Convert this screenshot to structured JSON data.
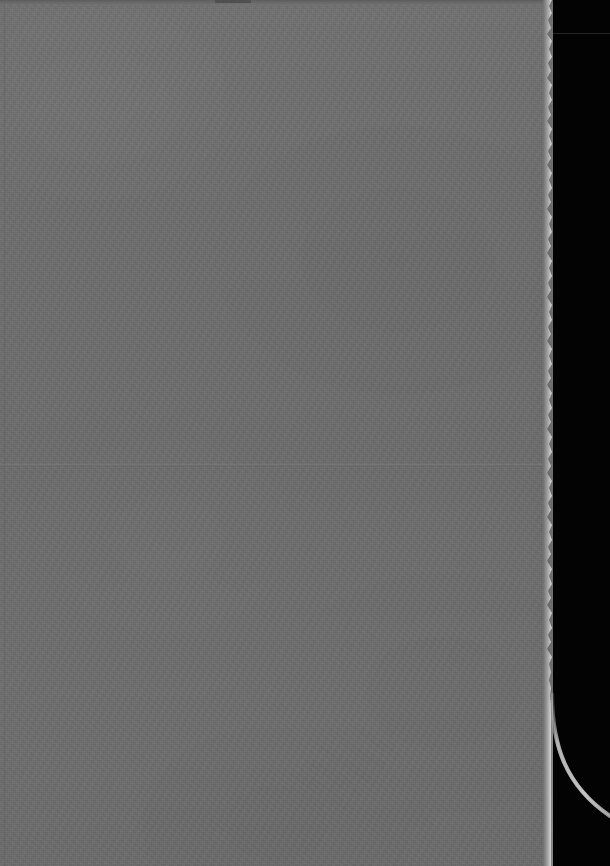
{
  "document": {
    "kind": "scanned-page",
    "page_state": "blank",
    "visible_text": "",
    "orientation": "portrait",
    "width_px": 610,
    "height_px": 866
  },
  "colors": {
    "paper": "#6f6f6f",
    "paper_top_edge": "#5d5d5d",
    "paper_top_notch": "#4e4e4e",
    "scanner_backdrop": "#030303",
    "torn_edge_highlight": "#d8d8d8",
    "crease_line": "#7e7e7e",
    "arc_line": "#b9b9b9",
    "backdrop_seam": "#2b2b2b"
  },
  "regions": {
    "paper_sheet": {
      "name": "paper-sheet",
      "left": 0,
      "top": 0,
      "width": 553,
      "height": 866
    },
    "scanner_backdrop": {
      "name": "scanner-backdrop",
      "left": 553,
      "top": 0,
      "width": 57,
      "height": 866
    }
  },
  "features": {
    "torn_right_edge": {
      "name": "torn-right-edge",
      "from_y": 0,
      "to_y": 700,
      "description": "ragged bright torn paper edge"
    },
    "smooth_right_edge": {
      "name": "smooth-right-edge",
      "from_y": 700,
      "to_y": 866
    },
    "horizontal_crease": {
      "name": "horizontal-crease",
      "y": 464
    },
    "left_fold_line": {
      "name": "left-fold-line",
      "x": 4
    },
    "top_edge_notch": {
      "name": "top-edge-notch",
      "x": 215,
      "width": 36
    },
    "curved_arc": {
      "name": "curved-arc",
      "start_x": 552,
      "start_y": 700,
      "end_x": 610,
      "end_y": 812
    },
    "backdrop_seam": {
      "name": "backdrop-seam",
      "y": 33
    }
  }
}
